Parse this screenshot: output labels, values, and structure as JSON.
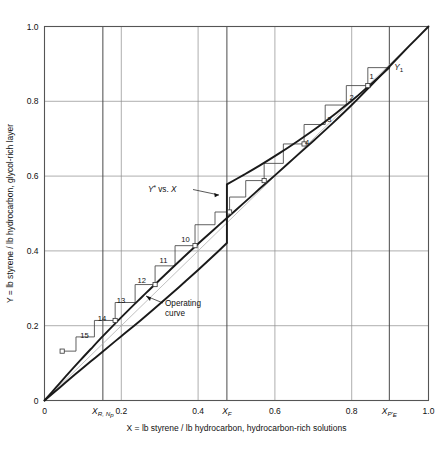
{
  "chart_data": {
    "type": "line",
    "title": "",
    "xlabel": "X = lb styrene / lb hydrocarbon, hydrocarbon-rich solutions",
    "ylabel": "Y = lb styrene / lb hydrocarbon, glycol-rich layer",
    "xlim": [
      0,
      1.0
    ],
    "ylim": [
      0,
      1.0
    ],
    "grid": true,
    "legend_position": "none",
    "x_ticks": [
      {
        "value": 0,
        "label": "0"
      },
      {
        "value": 0.2,
        "label": "0.2"
      },
      {
        "value": 0.4,
        "label": "0.4"
      },
      {
        "value": 0.6,
        "label": "0.6"
      },
      {
        "value": 0.8,
        "label": "0.8"
      },
      {
        "value": 1.0,
        "label": "1.0"
      }
    ],
    "y_ticks": [
      {
        "value": 0,
        "label": "0"
      },
      {
        "value": 0.2,
        "label": "0.2"
      },
      {
        "value": 0.4,
        "label": "0.4"
      },
      {
        "value": 0.6,
        "label": "0.6"
      },
      {
        "value": 0.8,
        "label": "0.8"
      },
      {
        "value": 1.0,
        "label": "1.0"
      }
    ],
    "special_x_markers": [
      {
        "value": 0.152,
        "label_main": "X",
        "label_sub": "R, N",
        "label_sub2": "p",
        "name": "X_R,Np"
      },
      {
        "value": 0.475,
        "label_main": "X",
        "label_sub": "F",
        "label_sub2": "",
        "name": "X_F"
      },
      {
        "value": 0.898,
        "label_main": "X",
        "label_sub": "P'",
        "label_sub2": "E",
        "name": "X_P'E"
      }
    ],
    "series": [
      {
        "name": "Y* vs. X (equilibrium curve)",
        "annotation": "Y* vs. X",
        "points": [
          [
            0.0,
            0.0
          ],
          [
            0.03,
            0.035
          ],
          [
            0.06,
            0.07
          ],
          [
            0.09,
            0.104
          ],
          [
            0.12,
            0.137
          ],
          [
            0.152,
            0.172
          ],
          [
            0.185,
            0.207
          ],
          [
            0.22,
            0.243
          ],
          [
            0.255,
            0.278
          ],
          [
            0.29,
            0.313
          ],
          [
            0.325,
            0.347
          ],
          [
            0.36,
            0.381
          ],
          [
            0.4,
            0.419
          ],
          [
            0.44,
            0.456
          ],
          [
            0.475,
            0.488
          ],
          [
            0.52,
            0.529
          ],
          [
            0.56,
            0.566
          ],
          [
            0.6,
            0.602
          ],
          [
            0.65,
            0.648
          ],
          [
            0.7,
            0.694
          ],
          [
            0.75,
            0.741
          ],
          [
            0.8,
            0.79
          ],
          [
            0.85,
            0.842
          ],
          [
            0.9,
            0.895
          ],
          [
            0.95,
            0.948
          ],
          [
            1.0,
            1.0
          ]
        ]
      },
      {
        "name": "Operating curve",
        "annotation": "Operating curve",
        "points": [
          [
            0.0,
            0.0
          ],
          [
            0.04,
            0.035
          ],
          [
            0.08,
            0.07
          ],
          [
            0.12,
            0.104
          ],
          [
            0.152,
            0.131
          ],
          [
            0.2,
            0.172
          ],
          [
            0.25,
            0.214
          ],
          [
            0.3,
            0.258
          ],
          [
            0.35,
            0.303
          ],
          [
            0.4,
            0.349
          ],
          [
            0.44,
            0.387
          ],
          [
            0.475,
            0.421
          ],
          [
            0.475,
            0.578
          ],
          [
            0.52,
            0.604
          ],
          [
            0.56,
            0.628
          ],
          [
            0.61,
            0.66
          ],
          [
            0.66,
            0.694
          ],
          [
            0.71,
            0.73
          ],
          [
            0.76,
            0.769
          ],
          [
            0.81,
            0.81
          ],
          [
            0.86,
            0.855
          ],
          [
            0.898,
            0.89
          ]
        ]
      },
      {
        "name": "45-degree diagonal",
        "annotation": "",
        "points": [
          [
            0.0,
            0.0
          ],
          [
            1.0,
            1.0
          ]
        ]
      }
    ],
    "terminal_point": {
      "label_main": "Y",
      "label_sub": "1",
      "x": 0.898,
      "y": 0.89
    },
    "stages": [
      {
        "number": "1",
        "show": true,
        "x_label": 0.852,
        "y_label": 0.868
      },
      {
        "number": "2",
        "show": true,
        "x_label": 0.8,
        "y_label": 0.812
      },
      {
        "number": "3",
        "show": true,
        "x_label": 0.742,
        "y_label": 0.752
      },
      {
        "number": "4",
        "show": true,
        "x_label": 0.684,
        "y_label": 0.692
      },
      {
        "number": "5",
        "show": false,
        "x_label": 0.63,
        "y_label": 0.638
      },
      {
        "number": "6",
        "show": false,
        "x_label": 0.58,
        "y_label": 0.588
      },
      {
        "number": "7",
        "show": false,
        "x_label": 0.535,
        "y_label": 0.543
      },
      {
        "number": "8",
        "show": false,
        "x_label": 0.495,
        "y_label": 0.503
      },
      {
        "number": "9",
        "show": false,
        "x_label": 0.43,
        "y_label": 0.44
      },
      {
        "number": "10",
        "show": true,
        "x_label": 0.367,
        "y_label": 0.432
      },
      {
        "number": "11",
        "show": true,
        "x_label": 0.31,
        "y_label": 0.376
      },
      {
        "number": "12",
        "show": true,
        "x_label": 0.253,
        "y_label": 0.322
      },
      {
        "number": "13",
        "show": true,
        "x_label": 0.199,
        "y_label": 0.27
      },
      {
        "number": "14",
        "show": true,
        "x_label": 0.15,
        "y_label": 0.22
      },
      {
        "number": "15",
        "show": true,
        "x_label": 0.104,
        "y_label": 0.174
      }
    ],
    "staircase_nodes": [
      [
        0.898,
        0.89
      ],
      [
        0.842,
        0.89
      ],
      [
        0.842,
        0.842
      ],
      [
        0.786,
        0.842
      ],
      [
        0.786,
        0.79
      ],
      [
        0.731,
        0.79
      ],
      [
        0.731,
        0.738
      ],
      [
        0.676,
        0.738
      ],
      [
        0.676,
        0.686
      ],
      [
        0.622,
        0.686
      ],
      [
        0.622,
        0.634
      ],
      [
        0.572,
        0.634
      ],
      [
        0.572,
        0.588
      ],
      [
        0.524,
        0.588
      ],
      [
        0.524,
        0.544
      ],
      [
        0.482,
        0.544
      ],
      [
        0.482,
        0.504
      ],
      [
        0.444,
        0.504
      ],
      [
        0.444,
        0.47
      ],
      [
        0.392,
        0.47
      ],
      [
        0.392,
        0.414
      ],
      [
        0.34,
        0.414
      ],
      [
        0.34,
        0.36
      ],
      [
        0.288,
        0.36
      ],
      [
        0.288,
        0.31
      ],
      [
        0.236,
        0.31
      ],
      [
        0.236,
        0.262
      ],
      [
        0.184,
        0.262
      ],
      [
        0.184,
        0.214
      ],
      [
        0.13,
        0.214
      ],
      [
        0.13,
        0.17
      ],
      [
        0.082,
        0.17
      ],
      [
        0.082,
        0.132
      ],
      [
        0.046,
        0.132
      ]
    ],
    "equilibrium_markers": [
      [
        0.842,
        0.842
      ],
      [
        0.676,
        0.686
      ],
      [
        0.572,
        0.588
      ],
      [
        0.482,
        0.504
      ],
      [
        0.392,
        0.414
      ],
      [
        0.288,
        0.31
      ],
      [
        0.184,
        0.214
      ],
      [
        0.046,
        0.132
      ]
    ],
    "colors": {
      "curve": "#1a1a1a",
      "grid": "#8c8c8c",
      "axis": "#555555",
      "diagonal": "#b0b0b0",
      "step": "#444444",
      "text": "#111111",
      "background": "#ffffff"
    }
  }
}
